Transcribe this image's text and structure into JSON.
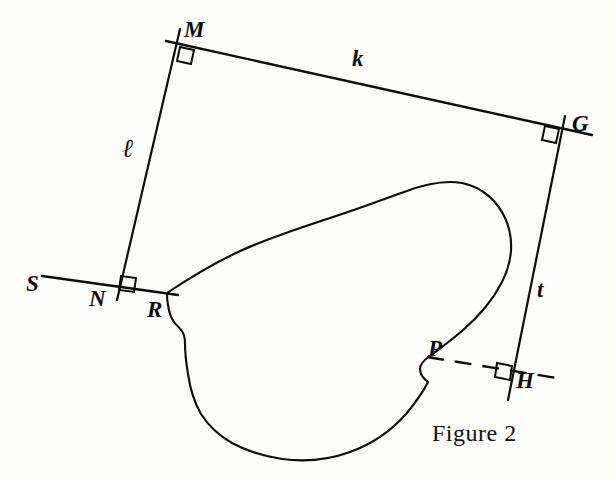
{
  "figure": {
    "caption": "Figure 2",
    "caption_pos": {
      "x": 432,
      "y": 420
    },
    "background_color": "#fdfdfc",
    "ink_color": "#0b0b0b"
  },
  "point_labels": [
    {
      "name": "M",
      "text": "M",
      "x": 184,
      "y": 18,
      "size": 23
    },
    {
      "name": "G",
      "text": "G",
      "x": 572,
      "y": 112,
      "size": 23
    },
    {
      "name": "S",
      "text": "S",
      "x": 26,
      "y": 272,
      "size": 23
    },
    {
      "name": "N",
      "text": "N",
      "x": 89,
      "y": 287,
      "size": 23
    },
    {
      "name": "R",
      "text": "R",
      "x": 147,
      "y": 298,
      "size": 23
    },
    {
      "name": "P",
      "text": "P",
      "x": 428,
      "y": 337,
      "size": 23
    },
    {
      "name": "H",
      "text": "H",
      "x": 516,
      "y": 369,
      "size": 23
    }
  ],
  "line_labels": [
    {
      "name": "k",
      "text": "k",
      "x": 352,
      "y": 47,
      "size": 23,
      "style": "bold-italic"
    },
    {
      "name": "t",
      "text": "t",
      "x": 537,
      "y": 278,
      "size": 23,
      "style": "bold-italic"
    },
    {
      "name": "ell",
      "text": "ℓ",
      "x": 122,
      "y": 135,
      "size": 26,
      "style": "script"
    }
  ],
  "geometry": {
    "vertices": {
      "M": {
        "x": 178,
        "y": 43
      },
      "G": {
        "x": 562,
        "y": 128
      },
      "N": {
        "x": 119,
        "y": 290
      },
      "R": {
        "x": 167,
        "y": 293
      },
      "P": {
        "x": 427,
        "y": 357
      },
      "H": {
        "x": 512,
        "y": 382
      },
      "S": {
        "x": 42,
        "y": 276
      }
    },
    "segments": [
      {
        "name": "line-k-MG",
        "from": "M",
        "to": "G",
        "label": "k",
        "dashed": false,
        "x1": 166,
        "y1": 41,
        "x2": 592,
        "y2": 135
      },
      {
        "name": "line-ell-MN",
        "from": "M",
        "to": "N",
        "label": "ℓ",
        "dashed": false,
        "x1": 180,
        "y1": 29,
        "x2": 117,
        "y2": 300
      },
      {
        "name": "line-t-GH",
        "from": "G",
        "to": "H",
        "label": "t",
        "dashed": false,
        "x1": 565,
        "y1": 116,
        "x2": 508,
        "y2": 400
      },
      {
        "name": "ray-S-N-R",
        "from": "S",
        "to": "R",
        "label": "",
        "dashed": false,
        "x1": 42,
        "y1": 276,
        "x2": 176,
        "y2": 295
      },
      {
        "name": "dashed-P-H",
        "from": "P",
        "to": "H",
        "label": "",
        "dashed": true,
        "x1": 427,
        "y1": 357,
        "x2": 563,
        "y2": 379
      }
    ],
    "right_angle_marks": [
      {
        "name": "right-angle-at-M",
        "at": "M",
        "x": 178,
        "y": 43,
        "size": 15,
        "rotation": 12
      },
      {
        "name": "right-angle-at-G",
        "at": "G",
        "x": 562,
        "y": 128,
        "size": 15,
        "rotation": 12
      },
      {
        "name": "right-angle-at-N",
        "at": "N",
        "x": 119,
        "y": 290,
        "size": 15,
        "rotation": 8
      },
      {
        "name": "right-angle-at-H",
        "at": "H",
        "x": 512,
        "y": 382,
        "size": 15,
        "rotation": 9
      }
    ],
    "blob": {
      "name": "irregular-closed-curve",
      "tangent_points": [
        "R",
        "P"
      ],
      "description": "kidney-shaped freehand closed curve tangent to ray SR at R and to dashed segment PH at P"
    }
  }
}
